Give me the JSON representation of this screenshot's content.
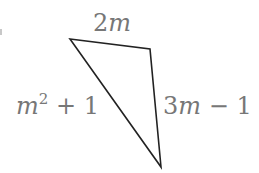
{
  "diagram": {
    "type": "triangle",
    "stroke_color": "#222222",
    "label_color": "#777777",
    "vertices": {
      "top_left": [
        70,
        39
      ],
      "top_right": [
        150,
        49
      ],
      "bottom": [
        161,
        167
      ]
    },
    "sides": {
      "top": {
        "coef": "2",
        "var": "m",
        "expression": "2m"
      },
      "left": {
        "var": "m",
        "exponent": "2",
        "rest": " + 1",
        "expression": "m^2 + 1"
      },
      "right": {
        "coef": "3",
        "var": "m",
        "rest": " − 1",
        "expression": "3m − 1"
      }
    }
  }
}
